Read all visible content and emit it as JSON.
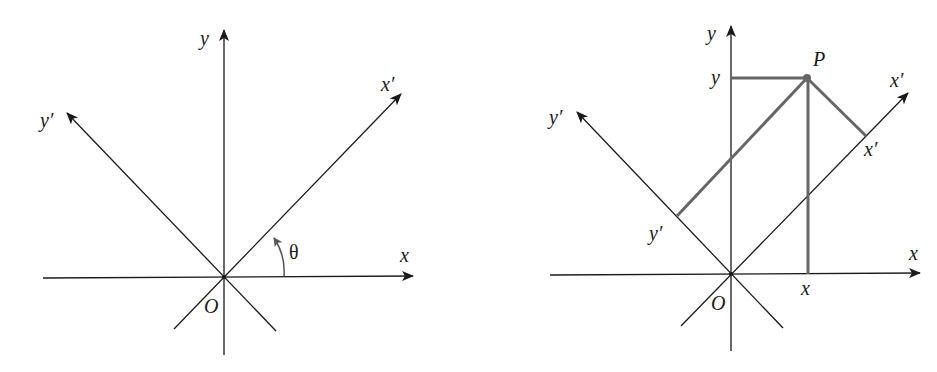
{
  "figure": {
    "colors": {
      "axis": "#1a1a1a",
      "projection": "#666666",
      "arc": "#555555"
    }
  },
  "left_panel": {
    "labels": {
      "y_axis": "y",
      "x_axis": "x",
      "x_prime_axis": "x′",
      "y_prime_axis": "y′",
      "angle": "θ",
      "origin": "O"
    }
  },
  "right_panel": {
    "labels": {
      "y_axis": "y",
      "x_axis": "x",
      "x_prime_axis": "x′",
      "y_prime_axis": "y′",
      "origin": "O",
      "point": "P",
      "y_coord": "y",
      "x_coord": "x",
      "x_prime_coord": "x′",
      "y_prime_coord": "y′"
    }
  }
}
